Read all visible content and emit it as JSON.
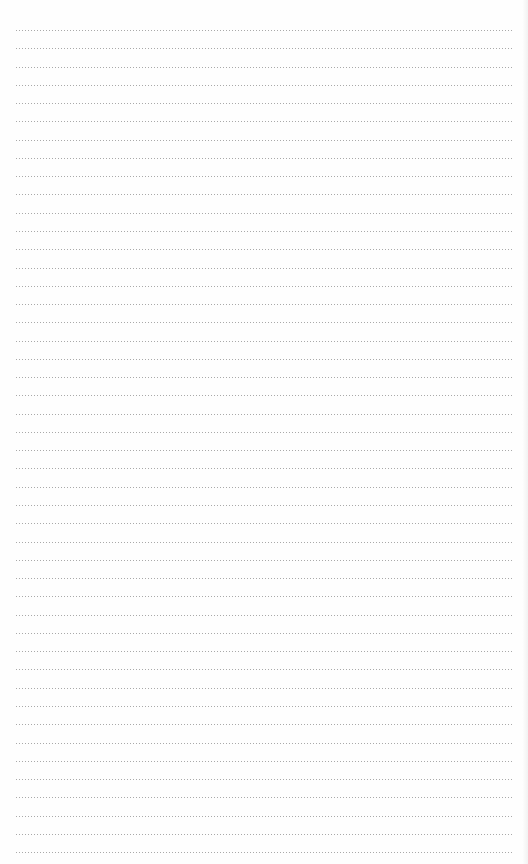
{
  "page": {
    "type": "ruled-paper",
    "line_style": "dotted",
    "line_color": "#8c8c8c",
    "background_color": "#fefefe",
    "line_count": 46,
    "first_line_y": 30,
    "line_spacing": 18.27,
    "line_left": 16,
    "line_right": 512
  }
}
